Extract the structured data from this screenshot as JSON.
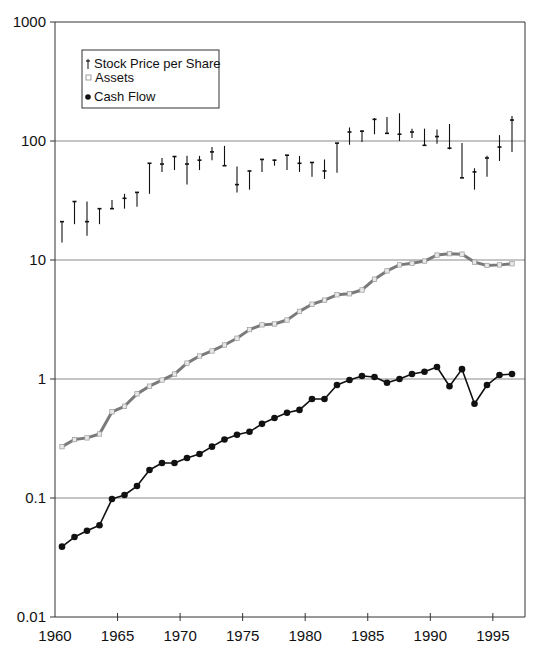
{
  "chart_data": {
    "type": "line",
    "title": "",
    "xlabel": "",
    "ylabel": "",
    "yscale": "log",
    "ylim": [
      0.01,
      1000
    ],
    "xlim": [
      1960,
      1997.5
    ],
    "grid": {
      "horizontal": true,
      "vertical": false
    },
    "legend_position": "upper-left-inside",
    "x_ticks": [
      1960,
      1965,
      1970,
      1975,
      1980,
      1985,
      1990,
      1995
    ],
    "y_ticks": [
      {
        "value": 1000,
        "label": "1000"
      },
      {
        "value": 100,
        "label": "100"
      },
      {
        "value": 10,
        "label": "10"
      },
      {
        "value": 1,
        "label": "1"
      },
      {
        "value": 0.1,
        "label": "0.1"
      },
      {
        "value": 0.01,
        "label": "0.01"
      }
    ],
    "x": [
      1960,
      1961,
      1962,
      1963,
      1964,
      1965,
      1966,
      1967,
      1968,
      1969,
      1970,
      1971,
      1972,
      1973,
      1974,
      1975,
      1976,
      1977,
      1978,
      1979,
      1980,
      1981,
      1982,
      1983,
      1984,
      1985,
      1986,
      1987,
      1988,
      1989,
      1990,
      1991,
      1992,
      1993,
      1994,
      1995,
      1996
    ],
    "series": [
      {
        "name": "Stock Price per Share",
        "marker": "high-low-close",
        "color": "#111111",
        "close": [
          21,
          31,
          21,
          27,
          27,
          33,
          37,
          65,
          64,
          74,
          64,
          69,
          81,
          62,
          43,
          56,
          70,
          69,
          76,
          65,
          66,
          56,
          96,
          119,
          121,
          152,
          116,
          114,
          119,
          92,
          109,
          87,
          49,
          55,
          72,
          89,
          150
        ],
        "high": [
          21,
          31,
          31,
          27,
          32,
          36,
          37,
          65,
          72,
          75,
          75,
          75,
          89,
          91,
          61,
          56,
          71,
          70,
          76,
          75,
          66,
          70,
          96,
          130,
          123,
          156,
          159,
          171,
          127,
          127,
          125,
          139,
          96,
          59,
          75,
          112,
          162
        ],
        "low": [
          14,
          20,
          16,
          20,
          27,
          27,
          28,
          36,
          55,
          57,
          43,
          57,
          69,
          62,
          37,
          39,
          55,
          62,
          57,
          55,
          50,
          48,
          54,
          93,
          98,
          114,
          116,
          100,
          106,
          92,
          95,
          85,
          49,
          39,
          50,
          68,
          81
        ]
      },
      {
        "name": "Assets",
        "marker": "open-square",
        "color": "#7a7a7a",
        "values": [
          0.27,
          0.31,
          0.32,
          0.345,
          0.53,
          0.59,
          0.75,
          0.87,
          0.98,
          1.1,
          1.36,
          1.56,
          1.72,
          1.93,
          2.2,
          2.6,
          2.85,
          2.9,
          3.13,
          3.7,
          4.25,
          4.6,
          5.1,
          5.2,
          5.6,
          6.9,
          8.1,
          9.1,
          9.4,
          9.8,
          11.0,
          11.3,
          11.2,
          9.6,
          9.0,
          9.1,
          9.3
        ]
      },
      {
        "name": "Cash Flow",
        "marker": "filled-circle",
        "color": "#111111",
        "values": [
          0.039,
          0.047,
          0.053,
          0.059,
          0.098,
          0.106,
          0.126,
          0.172,
          0.197,
          0.197,
          0.217,
          0.234,
          0.27,
          0.31,
          0.34,
          0.36,
          0.42,
          0.47,
          0.52,
          0.55,
          0.68,
          0.68,
          0.89,
          0.98,
          1.06,
          1.04,
          0.93,
          1.0,
          1.1,
          1.15,
          1.26,
          0.87,
          1.21,
          0.62,
          0.89,
          1.08,
          1.1
        ]
      }
    ]
  },
  "legend": {
    "items": [
      {
        "label": "Stock Price per Share",
        "symbol": "dagger"
      },
      {
        "label": "Assets",
        "symbol": "open-square"
      },
      {
        "label": "Cash Flow",
        "symbol": "filled-circle"
      }
    ]
  },
  "colors": {
    "axis": "#333333",
    "grid": "#8a8a8a",
    "assets_line": "#7a7a7a",
    "assets_marker_fill": "#e8e8e8",
    "cashflow": "#111111",
    "stock": "#111111"
  }
}
